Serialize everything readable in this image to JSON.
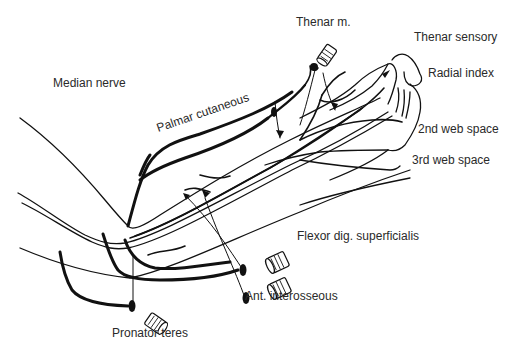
{
  "diagram": {
    "title": "Median nerve",
    "labels": {
      "median_nerve": "Median nerve",
      "palmar_cutaneous": "Palmar cutaneous",
      "thenar_m": "Thenar m.",
      "thenar_sensory": "Thenar sensory",
      "radial_index": "Radial index",
      "web_space_2": "2nd web space",
      "web_space_3": "3rd web space",
      "flexor_dig_superficialis": "Flexor dig. superficialis",
      "ant_interosseous": "Ant. interosseous",
      "pronator_teres": "Pronator teres"
    },
    "colors": {
      "ink": "#111111",
      "text": "#2a2a2a",
      "background": "#ffffff"
    }
  }
}
